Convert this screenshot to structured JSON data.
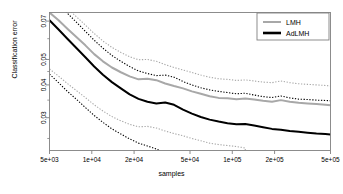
{
  "chart_data": {
    "type": "line",
    "title": "",
    "xlabel": "samples",
    "ylabel": "Classification error",
    "xscale": "log",
    "yscale": "log",
    "xlim": [
      5000,
      500000
    ],
    "ylim": [
      0.0225,
      0.0755
    ],
    "grid": false,
    "legend_position": "top-right",
    "xticks": [
      5000,
      10000,
      20000,
      50000,
      100000,
      200000,
      500000
    ],
    "xticklabels": [
      "5e+03",
      "1e+04",
      "2e+04",
      "5e+04",
      "1e+05",
      "2e+05",
      "5e+05"
    ],
    "yticks": [
      0.03,
      0.04,
      0.05,
      0.07
    ],
    "yticklabels": [
      "0.03",
      "0.04",
      "0.05",
      "0.07"
    ],
    "colors": {
      "lmh": "#a8a8a8",
      "adlmh": "#000000",
      "box": "#808080"
    },
    "series": [
      {
        "name": "LMH",
        "style": "solid",
        "color": "#a8a8a8",
        "x": [
          5000,
          5800,
          6700,
          7800,
          9000,
          10400,
          12000,
          13900,
          16100,
          18600,
          21500,
          24900,
          28800,
          33300,
          38500,
          44600,
          51600,
          59700,
          69000,
          79900,
          92400,
          107000,
          123700,
          143100,
          165600,
          191600,
          221700,
          256400,
          296700,
          343200,
          397100,
          459400,
          500000
        ],
        "values": [
          0.0755,
          0.0705,
          0.0655,
          0.0608,
          0.0566,
          0.0524,
          0.0492,
          0.0466,
          0.0447,
          0.0431,
          0.042,
          0.0422,
          0.0417,
          0.0405,
          0.0396,
          0.0388,
          0.0378,
          0.037,
          0.0362,
          0.0357,
          0.0356,
          0.0353,
          0.0355,
          0.0352,
          0.0348,
          0.0345,
          0.035,
          0.0345,
          0.0342,
          0.034,
          0.0338,
          0.0336,
          0.0335
        ]
      },
      {
        "name": "LMH upper band",
        "style": "dotted",
        "color": "#a8a8a8",
        "x": [
          5000,
          5800,
          6700,
          7800,
          9000,
          10400,
          12000,
          13900,
          16100,
          18600,
          21500,
          24900,
          28800,
          33300,
          38500,
          44600,
          51600,
          59700,
          69000,
          79900,
          92400,
          107000,
          123700,
          143100,
          165600,
          191600,
          221700,
          256400,
          296700,
          343200,
          397100,
          459400,
          500000
        ],
        "values": [
          0.09,
          0.084,
          0.0782,
          0.0726,
          0.0676,
          0.0628,
          0.0588,
          0.0556,
          0.0532,
          0.0512,
          0.0499,
          0.05,
          0.0492,
          0.0478,
          0.0466,
          0.0456,
          0.0446,
          0.0436,
          0.0428,
          0.0422,
          0.042,
          0.0416,
          0.0418,
          0.0414,
          0.041,
          0.0408,
          0.0414,
          0.0408,
          0.0404,
          0.0402,
          0.04,
          0.0398,
          0.0396
        ]
      },
      {
        "name": "LMH lower band",
        "style": "dotted",
        "color": "#a8a8a8",
        "x": [
          5000,
          5800,
          6700,
          7800,
          9000,
          10400,
          12000,
          13900,
          16100,
          18600,
          21500,
          24900,
          28800,
          33300,
          38500,
          44600,
          51600,
          59700,
          69000,
          79900,
          92400,
          107000,
          123700,
          123700
        ],
        "values": [
          0.046,
          0.0432,
          0.0405,
          0.038,
          0.0358,
          0.0336,
          0.0318,
          0.0303,
          0.0292,
          0.0283,
          0.0277,
          0.0278,
          0.0274,
          0.0267,
          0.0261,
          0.0256,
          0.025,
          0.0245,
          0.024,
          0.0237,
          0.0235,
          0.0233,
          0.023,
          0.0225
        ]
      },
      {
        "name": "AdLMH",
        "style": "solid",
        "color": "#000000",
        "x": [
          5000,
          5800,
          6700,
          7800,
          9000,
          10400,
          12000,
          13900,
          16100,
          18600,
          21500,
          24900,
          28800,
          33300,
          38500,
          44600,
          51600,
          59700,
          69000,
          79900,
          92400,
          107000,
          123700,
          143100,
          165600,
          191600,
          221700,
          256400,
          296700,
          343200,
          397100,
          459400,
          500000
        ],
        "values": [
          0.0705,
          0.065,
          0.06,
          0.0552,
          0.051,
          0.047,
          0.0437,
          0.041,
          0.0388,
          0.0368,
          0.0354,
          0.0345,
          0.034,
          0.0343,
          0.0336,
          0.0322,
          0.0311,
          0.0302,
          0.0295,
          0.029,
          0.0286,
          0.0283,
          0.0284,
          0.028,
          0.0276,
          0.0272,
          0.027,
          0.0267,
          0.0265,
          0.0263,
          0.0261,
          0.026,
          0.0259
        ]
      },
      {
        "name": "AdLMH upper band",
        "style": "dotted",
        "color": "#000000",
        "x": [
          5000,
          5800,
          6700,
          7800,
          9000,
          10400,
          12000,
          13900,
          16100,
          18600,
          21500,
          24900,
          28800,
          33300,
          38500,
          44600,
          51600,
          59700,
          69000,
          79900,
          92400,
          107000,
          123700,
          143100,
          165600,
          191600,
          221700,
          256400,
          296700,
          343200,
          397100,
          459400,
          500000
        ],
        "values": [
          0.088,
          0.0812,
          0.075,
          0.0692,
          0.064,
          0.0592,
          0.0552,
          0.0518,
          0.0492,
          0.047,
          0.0452,
          0.0442,
          0.0434,
          0.0436,
          0.0428,
          0.0412,
          0.04,
          0.039,
          0.0383,
          0.0378,
          0.0374,
          0.037,
          0.0372,
          0.0366,
          0.0361,
          0.0358,
          0.0363,
          0.0357,
          0.0353,
          0.0352,
          0.035,
          0.0349,
          0.0348
        ]
      },
      {
        "name": "AdLMH lower band",
        "style": "dotted",
        "color": "#000000",
        "x": [
          5000,
          5800,
          6700,
          7800,
          9000,
          10400,
          12000,
          13900,
          16100,
          18600,
          21500,
          24900,
          28800,
          30500
        ],
        "values": [
          0.044,
          0.0408,
          0.0378,
          0.0352,
          0.0328,
          0.0306,
          0.0288,
          0.0272,
          0.026,
          0.0249,
          0.024,
          0.0234,
          0.0228,
          0.0225
        ]
      }
    ]
  },
  "legend": {
    "entries": [
      {
        "label": "LMH",
        "color": "#a8a8a8"
      },
      {
        "label": "AdLMH",
        "color": "#000000"
      }
    ]
  }
}
